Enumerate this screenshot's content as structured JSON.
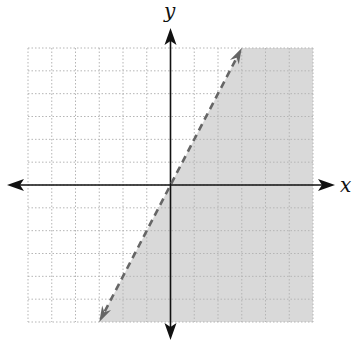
{
  "chart_data": {
    "type": "line",
    "title": "",
    "xlabel": "x",
    "ylabel": "y",
    "xlim": [
      -6,
      6
    ],
    "ylim": [
      -6,
      6
    ],
    "grid": true,
    "grid_style": "dotted",
    "tick_labels": false,
    "series": [
      {
        "name": "boundary",
        "equation": "y = 2x",
        "slope": 2,
        "intercept": 0,
        "style": "dashed",
        "arrows": "both",
        "x": [
          -3,
          3
        ],
        "y": [
          -6,
          6
        ]
      }
    ],
    "shaded_region": {
      "inequality": "y < 2x",
      "side": "below-right of line",
      "polygon": [
        [
          -3,
          -6
        ],
        [
          3,
          6
        ],
        [
          6,
          6
        ],
        [
          6,
          -6
        ]
      ]
    },
    "colors": {
      "shade": "#d9d9d9",
      "boundary_line": "#666666",
      "axis": "#111111",
      "grid": "#b5b5b5"
    }
  }
}
